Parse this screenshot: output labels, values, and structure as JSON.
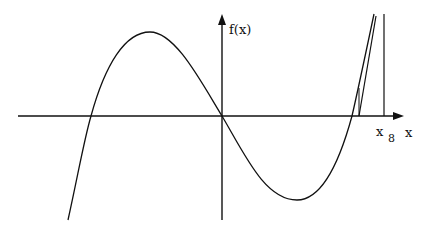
{
  "diagram": {
    "y_axis_label": "f(x)",
    "x_axis_label": "x",
    "point_label": "x",
    "point_subscript": "8",
    "stroke_color": "#111111",
    "background": "#ffffff"
  }
}
